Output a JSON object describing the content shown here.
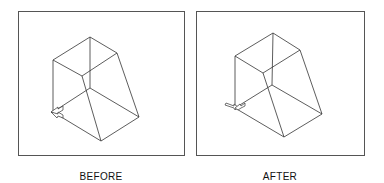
{
  "panels": [
    {
      "id": "before",
      "label": "BEFORE",
      "ucs_icon": "ucs-icon-default"
    },
    {
      "id": "after",
      "label": "AFTER",
      "ucs_icon": "ucs-icon-rotated"
    }
  ],
  "colors": {
    "line": "#333333",
    "frame": "#555555",
    "background": "#ffffff"
  }
}
